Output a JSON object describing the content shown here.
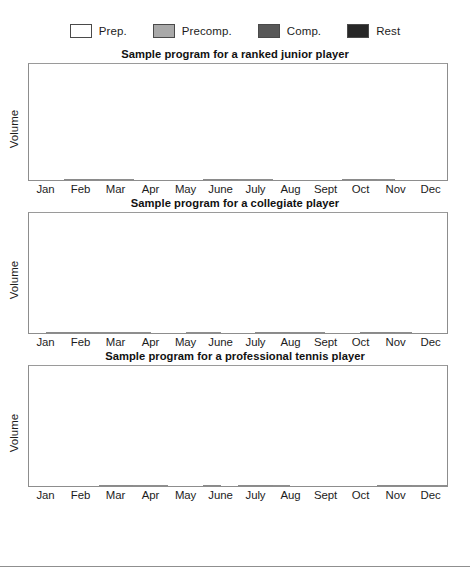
{
  "legend": {
    "items": [
      {
        "label": "Prep.",
        "key": "prep",
        "color": "#ffffff"
      },
      {
        "label": "Precomp.",
        "key": "precomp",
        "color": "#a9a9a9"
      },
      {
        "label": "Comp.",
        "key": "comp",
        "color": "#585858"
      },
      {
        "label": "Rest",
        "key": "rest",
        "color": "#272727"
      }
    ]
  },
  "axis": {
    "ylabel": "Volume",
    "months": [
      "Jan",
      "Feb",
      "Mar",
      "Apr",
      "May",
      "June",
      "July",
      "Aug",
      "Sept",
      "Oct",
      "Nov",
      "Dec"
    ]
  },
  "footer": {
    "partial_caption": ""
  },
  "charts": [
    {
      "title": "Sample program for a ranked junior player"
    },
    {
      "title": "Sample program for a collegiate player"
    },
    {
      "title": "Sample program for a professional tennis player"
    }
  ],
  "chart_data": [
    {
      "type": "bar",
      "title": "Sample program for a ranked junior player",
      "xlabel": "",
      "ylabel": "Volume",
      "ylim": [
        0,
        100
      ],
      "grid": false,
      "legend_position": "top",
      "note": "Each month is split into two half-month bars; value is % of plot height, phase gives the fill category.",
      "categories": [
        "Jan",
        "Feb",
        "Mar",
        "Apr",
        "May",
        "June",
        "July",
        "Aug",
        "Sept",
        "Oct",
        "Nov",
        "Dec"
      ],
      "bars": [
        {
          "month": "Jan",
          "halves": [
            {
              "phase": "rest",
              "value": 16
            },
            {
              "phase": "rest",
              "value": 26
            }
          ]
        },
        {
          "month": "Feb",
          "halves": [
            {
              "phase": "prep",
              "value": 45
            },
            {
              "phase": "prep",
              "value": 53
            }
          ]
        },
        {
          "month": "Mar",
          "halves": [
            {
              "phase": "precomp",
              "value": 64
            },
            {
              "phase": "precomp",
              "value": 74
            }
          ]
        },
        {
          "month": "Apr",
          "halves": [
            {
              "phase": "comp",
              "value": 94
            },
            {
              "phase": "comp",
              "value": 86
            }
          ]
        },
        {
          "month": "May",
          "halves": [
            {
              "phase": "rest",
              "value": 16
            },
            {
              "phase": "rest",
              "value": 27
            }
          ]
        },
        {
          "month": "June",
          "halves": [
            {
              "phase": "prep",
              "value": 45
            },
            {
              "phase": "prep",
              "value": 53
            }
          ]
        },
        {
          "month": "July",
          "halves": [
            {
              "phase": "precomp",
              "value": 64
            },
            {
              "phase": "precomp",
              "value": 74
            }
          ]
        },
        {
          "month": "Aug",
          "halves": [
            {
              "phase": "comp",
              "value": 94
            },
            {
              "phase": "comp",
              "value": 86
            }
          ]
        },
        {
          "month": "Sept",
          "halves": [
            {
              "phase": "rest",
              "value": 16
            },
            {
              "phase": "rest",
              "value": 26
            }
          ]
        },
        {
          "month": "Oct",
          "halves": [
            {
              "phase": "prep",
              "value": 45
            },
            {
              "phase": "prep",
              "value": 53
            }
          ]
        },
        {
          "month": "Nov",
          "halves": [
            {
              "phase": "precomp",
              "value": 64
            },
            {
              "phase": "comp",
              "value": 94
            }
          ]
        },
        {
          "month": "Dec",
          "halves": [
            {
              "phase": "comp",
              "value": 86
            },
            {
              "phase": "rest",
              "value": 16
            }
          ]
        }
      ]
    },
    {
      "type": "bar",
      "title": "Sample program for a collegiate player",
      "xlabel": "",
      "ylabel": "Volume",
      "ylim": [
        0,
        100
      ],
      "grid": false,
      "legend_position": "top",
      "note": "Each month is split into two half-month bars; value is % of plot height, phase gives the fill category.",
      "categories": [
        "Jan",
        "Feb",
        "Mar",
        "Apr",
        "May",
        "June",
        "July",
        "Aug",
        "Sept",
        "Oct",
        "Nov",
        "Dec"
      ],
      "bars": [
        {
          "month": "Jan",
          "halves": [
            {
              "phase": "rest",
              "value": 23
            },
            {
              "phase": "prep",
              "value": 30
            }
          ]
        },
        {
          "month": "Feb",
          "halves": [
            {
              "phase": "prep",
              "value": 38
            },
            {
              "phase": "prep",
              "value": 46
            }
          ]
        },
        {
          "month": "Mar",
          "halves": [
            {
              "phase": "precomp",
              "value": 58
            },
            {
              "phase": "precomp",
              "value": 67
            }
          ]
        },
        {
          "month": "Apr",
          "halves": [
            {
              "phase": "precomp",
              "value": 76
            },
            {
              "phase": "comp",
              "value": 84
            }
          ]
        },
        {
          "month": "May",
          "halves": [
            {
              "phase": "comp",
              "value": 95
            },
            {
              "phase": "precomp",
              "value": 76
            }
          ]
        },
        {
          "month": "June",
          "halves": [
            {
              "phase": "precomp",
              "value": 95
            },
            {
              "phase": "rest",
              "value": 14
            }
          ]
        },
        {
          "month": "July",
          "halves": [
            {
              "phase": "rest",
              "value": 23
            },
            {
              "phase": "prep",
              "value": 32
            }
          ]
        },
        {
          "month": "Aug",
          "halves": [
            {
              "phase": "prep",
              "value": 39
            },
            {
              "phase": "precomp",
              "value": 68
            }
          ]
        },
        {
          "month": "Sept",
          "halves": [
            {
              "phase": "precomp",
              "value": 76
            },
            {
              "phase": "comp",
              "value": 84
            }
          ]
        },
        {
          "month": "Oct",
          "halves": [
            {
              "phase": "comp",
              "value": 95
            },
            {
              "phase": "prep",
              "value": 39
            }
          ]
        },
        {
          "month": "Nov",
          "halves": [
            {
              "phase": "prep",
              "value": 39
            },
            {
              "phase": "precomp",
              "value": 60
            }
          ]
        },
        {
          "month": "Dec",
          "halves": [
            {
              "phase": "comp",
              "value": 95
            },
            {
              "phase": "rest",
              "value": 19
            }
          ]
        }
      ]
    },
    {
      "type": "bar",
      "title": "Sample program for a professional tennis player",
      "xlabel": "",
      "ylabel": "Volume",
      "ylim": [
        0,
        100
      ],
      "grid": false,
      "legend_position": "top",
      "note": "Each month is split into two half-month bars; value is % of plot height, phase gives the fill category.",
      "categories": [
        "Jan",
        "Feb",
        "Mar",
        "Apr",
        "May",
        "June",
        "July",
        "Aug",
        "Sept",
        "Oct",
        "Nov",
        "Dec"
      ],
      "bars": [
        {
          "month": "Jan",
          "halves": [
            {
              "phase": "comp",
              "value": 85
            },
            {
              "phase": "comp",
              "value": 93
            }
          ]
        },
        {
          "month": "Feb",
          "halves": [
            {
              "phase": "rest",
              "value": 14
            },
            {
              "phase": "rest",
              "value": 23
            }
          ]
        },
        {
          "month": "Mar",
          "halves": [
            {
              "phase": "prep",
              "value": 31
            },
            {
              "phase": "prep",
              "value": 41
            }
          ]
        },
        {
          "month": "Apr",
          "halves": [
            {
              "phase": "precomp",
              "value": 54
            },
            {
              "phase": "precomp",
              "value": 63
            }
          ]
        },
        {
          "month": "May",
          "halves": [
            {
              "phase": "comp",
              "value": 93
            },
            {
              "phase": "comp",
              "value": 85
            }
          ]
        },
        {
          "month": "June",
          "halves": [
            {
              "phase": "prep",
              "value": 44
            },
            {
              "phase": "comp",
              "value": 93
            }
          ]
        },
        {
          "month": "July",
          "halves": [
            {
              "phase": "prep",
              "value": 36
            },
            {
              "phase": "prep",
              "value": 44
            }
          ]
        },
        {
          "month": "Aug",
          "halves": [
            {
              "phase": "precomp",
              "value": 65
            },
            {
              "phase": "comp",
              "value": 93
            }
          ]
        },
        {
          "month": "Sept",
          "halves": [
            {
              "phase": "comp",
              "value": 85
            },
            {
              "phase": "rest",
              "value": 14
            }
          ]
        },
        {
          "month": "Oct",
          "halves": [
            {
              "phase": "rest",
              "value": 14
            },
            {
              "phase": "rest",
              "value": 25
            }
          ]
        },
        {
          "month": "Nov",
          "halves": [
            {
              "phase": "prep",
              "value": 32
            },
            {
              "phase": "prep",
              "value": 44
            }
          ]
        },
        {
          "month": "Dec",
          "halves": [
            {
              "phase": "precomp",
              "value": 56
            },
            {
              "phase": "precomp",
              "value": 65
            }
          ]
        }
      ]
    }
  ]
}
